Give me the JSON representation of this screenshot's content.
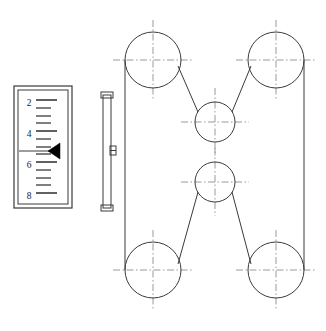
{
  "drawing": {
    "title": "Belt drive assembly with measuring scale",
    "background_color": "#ffffff",
    "line_color": "#3a3a3a",
    "centerline_color": "#9a9a9a",
    "pointer_color": "#000000"
  },
  "gauge": {
    "name": "measuring-scale",
    "outer_frame": {
      "x": 14,
      "y": 86,
      "width": 58,
      "height": 122
    },
    "inner_frame": {
      "x": 18,
      "y": 90,
      "width": 50,
      "height": 114
    },
    "labels": [
      {
        "value": "2",
        "x": 29,
        "y": 103
      },
      {
        "value": "4",
        "x": 29,
        "y": 134
      },
      {
        "value": "6",
        "x": 29,
        "y": 165
      },
      {
        "value": "8",
        "x": 29,
        "y": 196
      }
    ],
    "major_ticks_y": [
      100,
      131,
      162,
      193
    ],
    "minor_ticks_y": [
      108,
      116,
      123,
      139,
      147,
      154,
      170,
      178,
      185
    ],
    "major_tick": {
      "x1": 36,
      "x2": 57
    },
    "minor_tick": {
      "x1": 36,
      "x2": 51
    },
    "pointer": {
      "name": "scale-pointer",
      "reading": "5",
      "line_y": 151,
      "line_x1": 19,
      "line_x2": 60,
      "triangle": "60,143 60,159 48,151"
    }
  },
  "rail": {
    "name": "vertical-guide-rail",
    "body": {
      "x": 103,
      "y": 95,
      "width": 8,
      "height": 113
    },
    "cap_top": {
      "x": 101,
      "y": 92,
      "width": 12,
      "height": 6
    },
    "cap_bottom": {
      "x": 101,
      "y": 205,
      "width": 12,
      "height": 6
    },
    "bracket": {
      "x": 110,
      "y": 146,
      "width": 6,
      "height": 9
    },
    "bracket_mid_y": 150.5
  },
  "belt_drive": {
    "name": "belt-pulley-system",
    "pulleys": [
      {
        "id": "top-left",
        "cx": 153,
        "cy": 60,
        "r": 28,
        "size": "large"
      },
      {
        "id": "top-right",
        "cx": 276,
        "cy": 60,
        "r": 28,
        "size": "large"
      },
      {
        "id": "center-upper",
        "cx": 215,
        "cy": 122,
        "r": 20,
        "size": "small"
      },
      {
        "id": "center-lower",
        "cx": 215,
        "cy": 182,
        "r": 20,
        "size": "small"
      },
      {
        "id": "bottom-left",
        "cx": 153,
        "cy": 270,
        "r": 28,
        "size": "large"
      },
      {
        "id": "bottom-right",
        "cx": 276,
        "cy": 270,
        "r": 28,
        "size": "large"
      }
    ],
    "belt_segments": [
      {
        "id": "left-span",
        "x1": 125,
        "y1": 60,
        "x2": 125,
        "y2": 270
      },
      {
        "id": "right-span",
        "x1": 304,
        "y1": 60,
        "x2": 304,
        "y2": 270
      },
      {
        "id": "upper-left-diag",
        "x1": 178,
        "y1": 66,
        "x2": 198,
        "y2": 112
      },
      {
        "id": "upper-right-diag",
        "x1": 251,
        "y1": 66,
        "x2": 232,
        "y2": 112
      },
      {
        "id": "lower-left-diag",
        "x1": 198,
        "y1": 192,
        "x2": 178,
        "y2": 264
      },
      {
        "id": "lower-right-diag",
        "x1": 232,
        "y1": 192,
        "x2": 251,
        "y2": 264
      }
    ],
    "centerline_extension_large": 12,
    "centerline_extension_small": 14
  }
}
